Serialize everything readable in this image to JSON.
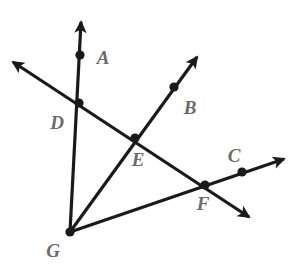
{
  "figure": {
    "type": "geometry-diagram",
    "width": 295,
    "height": 268,
    "background_color": "#ffffff",
    "stroke_color": "#1a1a1a",
    "label_color": "#6b6b6b",
    "stroke_width": 3.2,
    "dot_radius": 4.6,
    "vertex": {
      "name": "G",
      "x": 70,
      "y": 232
    },
    "points": [
      {
        "id": "A",
        "label": "A",
        "x": 80,
        "y": 55,
        "label_x": 103,
        "label_y": 57,
        "dot": true
      },
      {
        "id": "B",
        "label": "B",
        "x": 174,
        "y": 87,
        "label_x": 190,
        "label_y": 107,
        "dot": true
      },
      {
        "id": "C",
        "label": "C",
        "x": 242,
        "y": 172,
        "label_x": 234,
        "label_y": 155,
        "dot": true
      },
      {
        "id": "D",
        "label": "D",
        "x": 79,
        "y": 103,
        "label_x": 57,
        "label_y": 122,
        "dot": true
      },
      {
        "id": "E",
        "label": "E",
        "x": 135,
        "y": 138,
        "label_x": 138,
        "label_y": 159,
        "dot": true
      },
      {
        "id": "F",
        "label": "F",
        "x": 205,
        "y": 185,
        "label_x": 203,
        "label_y": 203,
        "dot": true
      },
      {
        "id": "G",
        "label": "G",
        "x": 70,
        "y": 232,
        "label_x": 53,
        "label_y": 250,
        "dot": true
      }
    ],
    "rays": [
      {
        "id": "ray-GA",
        "name": "ray-g-through-d-a",
        "from_x": 70,
        "from_y": 232,
        "to_x": 81,
        "to_y": 22,
        "arrow_end": true,
        "arrow_start": false,
        "passes_through": [
          "G",
          "D",
          "A"
        ]
      },
      {
        "id": "ray-GB",
        "name": "ray-g-through-e-b",
        "from_x": 70,
        "from_y": 232,
        "to_x": 197,
        "to_y": 57,
        "arrow_end": true,
        "arrow_start": false,
        "passes_through": [
          "G",
          "E",
          "B"
        ]
      },
      {
        "id": "ray-GC",
        "name": "ray-g-through-f-c",
        "from_x": 70,
        "from_y": 232,
        "to_x": 284,
        "to_y": 159,
        "arrow_end": true,
        "arrow_start": false,
        "passes_through": [
          "G",
          "F",
          "C"
        ]
      }
    ],
    "lines": [
      {
        "id": "line-DEF",
        "name": "transversal-line-d-e-f",
        "from_x": 13,
        "from_y": 62,
        "to_x": 249,
        "to_y": 217,
        "arrow_end": true,
        "arrow_start": true,
        "passes_through": [
          "D",
          "E",
          "F"
        ]
      }
    ]
  }
}
